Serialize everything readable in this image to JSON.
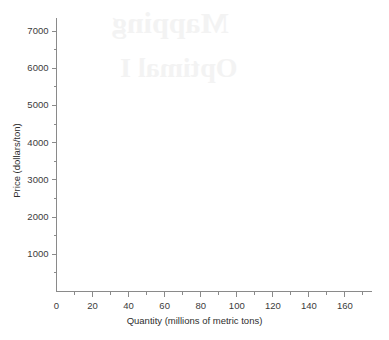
{
  "figure": {
    "kind": "blank-graph-template",
    "background_color": "#ffffff",
    "axis_color": "#8a8a8a",
    "tick_color": "#8a8a8a",
    "label_color": "#3b3b3b",
    "title_color": "#2e2e2e"
  },
  "bleed_through": {
    "note": "faint mirrored text showing through from the reverse side of the page",
    "line1": "Mapping",
    "line2": "Optimal I",
    "color": "#f2f2f2"
  },
  "chart_data": {
    "type": "line",
    "title": "",
    "subtitle": "",
    "xlabel": "Quantity (millions of metric tons)",
    "ylabel": "Price (dollars/ton)",
    "xlim": [
      0,
      175
    ],
    "ylim": [
      0,
      7350
    ],
    "x_major_ticks": [
      0,
      20,
      40,
      60,
      80,
      100,
      120,
      140,
      160
    ],
    "x_major_tick_labels": [
      "0",
      "20",
      "40",
      "60",
      "80",
      "100",
      "120",
      "140",
      "160"
    ],
    "x_minor_ticks": [
      10,
      30,
      50,
      70,
      90,
      110,
      130,
      150,
      170
    ],
    "x_tick_interval": 20,
    "x_minor_tick_interval": 10,
    "y_major_ticks": [
      0,
      1000,
      2000,
      3000,
      4000,
      5000,
      6000,
      7000
    ],
    "y_major_tick_labels": [
      "",
      "1000",
      "2000",
      "3000",
      "4000",
      "5000",
      "6000",
      "7000"
    ],
    "y_minor_ticks": [
      500,
      1500,
      2500,
      3500,
      4500,
      5500,
      6500
    ],
    "y_tick_interval": 1000,
    "y_minor_tick_interval": 500,
    "tick_direction": "out",
    "grid": false,
    "legend": null,
    "series": [],
    "annotations": [],
    "data_points_plotted": 0
  }
}
